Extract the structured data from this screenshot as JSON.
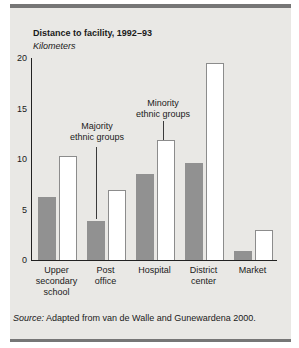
{
  "figure": {
    "title": "Distance to facility, 1992–93",
    "unit_label": "Kilometers",
    "source_prefix": "Source:",
    "source_text": "Adapted from van de Walle and Gunewardena 2000."
  },
  "chart_data": {
    "type": "bar",
    "title": "Distance to facility, 1992–93",
    "ylabel": "Kilometers",
    "ylim": [
      0,
      20
    ],
    "yticks": [
      0,
      5,
      10,
      15,
      20
    ],
    "grid": false,
    "categories": [
      "Upper secondary school",
      "Post office",
      "Hospital",
      "District center",
      "Market"
    ],
    "category_label_lines": [
      [
        "Upper",
        "secondary",
        "school"
      ],
      [
        "Post",
        "office"
      ],
      [
        "Hospital"
      ],
      [
        "District",
        "center"
      ],
      [
        "Market"
      ]
    ],
    "series": [
      {
        "name": "Majority ethnic groups",
        "fill": "#919191",
        "values": [
          6.2,
          3.9,
          8.5,
          9.6,
          0.9
        ]
      },
      {
        "name": "Minority ethnic groups",
        "fill": "#ffffff",
        "values": [
          10.3,
          6.9,
          11.9,
          19.5,
          3.0
        ]
      }
    ],
    "legend_position": "callout-labels-inside-plot",
    "annotations": [
      {
        "lines": [
          "Majority",
          "ethnic groups"
        ],
        "series": "Majority ethnic groups",
        "target_category": "Post office"
      },
      {
        "lines": [
          "Minority",
          "ethnic groups"
        ],
        "series": "Minority ethnic groups",
        "target_category": "Hospital"
      }
    ],
    "source": "Source: Adapted from van de Walle and Gunewardena 2000."
  },
  "colors": {
    "panel_background": "#e9e8e5",
    "rule_stripe": "#767676",
    "majority_bar": "#919191",
    "minority_bar": "#ffffff",
    "axis": "#222222"
  }
}
